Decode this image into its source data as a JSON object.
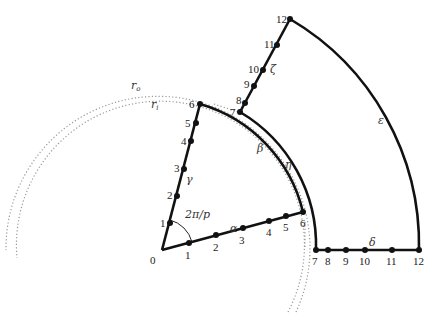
{
  "diagram": {
    "type": "sector-meshing-diagram",
    "wedge_angle_label": "2π/p",
    "radius_labels": {
      "outer": "r_o",
      "inner": "r_i"
    },
    "radius_label_text": {
      "outer_main": "r",
      "outer_sub": "o",
      "inner_main": "r",
      "inner_sub": "i"
    },
    "colors": {
      "stroke": "#111111",
      "dotted": "#999999",
      "text": "#222222"
    },
    "inner_wedge": {
      "apex_label": "0",
      "edge_alpha": {
        "name": "α",
        "node_labels": [
          "1",
          "2",
          "3",
          "4",
          "5",
          "6"
        ]
      },
      "edge_gamma": {
        "name": "γ",
        "node_labels": [
          "1",
          "2",
          "3",
          "4",
          "5",
          "6"
        ]
      },
      "arc_beta": {
        "name": "β"
      }
    },
    "outer_sector": {
      "edge_delta": {
        "name": "δ",
        "node_labels": [
          "7",
          "8",
          "9",
          "10",
          "11",
          "12"
        ]
      },
      "edge_zeta": {
        "name": "ζ",
        "node_labels": [
          "7",
          "8",
          "9",
          "10",
          "11",
          "12"
        ]
      },
      "arc_eta": {
        "name": "η"
      },
      "arc_epsilon": {
        "name": "ε"
      }
    }
  }
}
